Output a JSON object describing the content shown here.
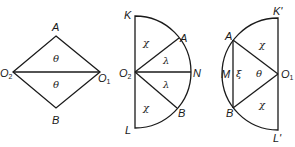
{
  "figure_1": {
    "points": {
      "top": "A",
      "bottom": "B",
      "left": "O",
      "left_sub": "2",
      "right": "O",
      "right_sub": "1"
    },
    "angles": {
      "upper": "θ",
      "lower": "θ"
    }
  },
  "figure_2": {
    "points": {
      "top": "K",
      "bottom": "L",
      "center": "O",
      "center_sub": "2",
      "right": "N",
      "upper_arc": "A",
      "lower_arc": "B"
    },
    "angles": {
      "upper_sector": "χ",
      "upper_mid": "λ",
      "lower_mid": "λ",
      "lower_sector": "χ"
    }
  },
  "figure_3": {
    "points": {
      "top": "K'",
      "bottom": "L'",
      "center": "O",
      "center_sub": "1",
      "left": "M",
      "upper_arc": "A",
      "lower_arc": "B"
    },
    "angles": {
      "upper_sector": "χ",
      "middle": "θ",
      "segment": "ξ",
      "lower_sector": "χ"
    }
  }
}
